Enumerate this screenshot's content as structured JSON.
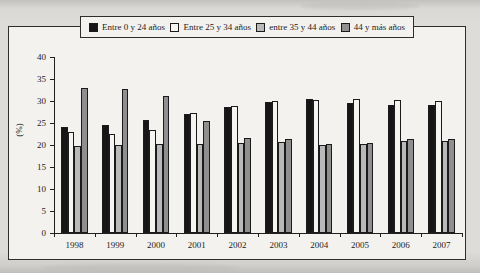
{
  "figure": {
    "paper_color": "#dedcd8",
    "panel_color": "#f4f2ee",
    "frame_border_color": "#2e2e2e"
  },
  "legend": {
    "position": "top-center",
    "items": [
      {
        "icon": "black-filled-square-swatch",
        "color": "#161616",
        "label": "Entre 0 y 24 años"
      },
      {
        "icon": "white-square-swatch",
        "color": "#f6f5f2",
        "label": "Entre 25 y 34 años"
      },
      {
        "icon": "light-gray-square-swatch",
        "color": "#b9b9b9",
        "label": "entre 35 y 44 años"
      },
      {
        "icon": "dark-gray-square-swatch",
        "color": "#8f8f8f",
        "label": "44 y más años"
      }
    ]
  },
  "chart_data": {
    "type": "bar",
    "title": "",
    "xlabel": "",
    "ylabel": "(%)",
    "ylim": [
      0,
      40
    ],
    "yticks": [
      0,
      5,
      10,
      15,
      20,
      25,
      30,
      35,
      40
    ],
    "grid": false,
    "legend_position": "top-center",
    "categories": [
      "1998",
      "1999",
      "2000",
      "2001",
      "2002",
      "2003",
      "2004",
      "2005",
      "2006",
      "2007"
    ],
    "series": [
      {
        "name": "Entre 0 y 24 años",
        "color": "#161616",
        "values": [
          24.0,
          24.6,
          25.7,
          27.0,
          28.7,
          29.8,
          30.4,
          29.6,
          29.1,
          29.0
        ]
      },
      {
        "name": "Entre 25 y 34 años",
        "color": "#f6f5f2",
        "values": [
          23.0,
          22.5,
          23.4,
          27.2,
          28.9,
          30.0,
          30.2,
          30.5,
          30.3,
          30.0
        ]
      },
      {
        "name": "entre 35 y 44 años",
        "color": "#b9b9b9",
        "values": [
          19.8,
          20.0,
          20.2,
          20.3,
          20.4,
          20.6,
          20.1,
          20.3,
          21.0,
          20.8
        ]
      },
      {
        "name": "44 y más años",
        "color": "#8f8f8f",
        "values": [
          33.0,
          32.8,
          31.1,
          25.5,
          21.6,
          21.3,
          20.2,
          20.5,
          21.4,
          21.3
        ]
      }
    ]
  }
}
